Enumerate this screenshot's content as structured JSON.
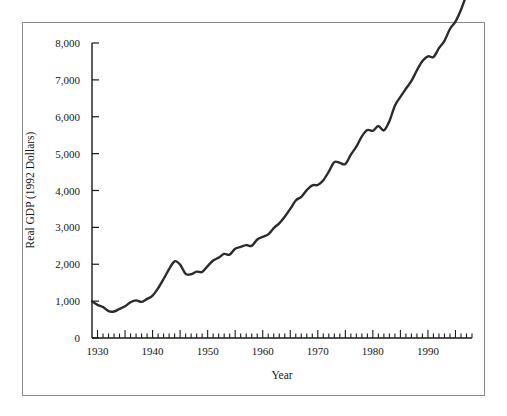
{
  "chart_data": {
    "type": "line",
    "title": "",
    "xlabel": "Year",
    "ylabel": "Real GDP (1992 Dollars)",
    "xlim": [
      1929,
      1998
    ],
    "ylim": [
      0,
      8000
    ],
    "grid": false,
    "legend": "none",
    "x_ticks_major": [
      1930,
      1940,
      1950,
      1960,
      1970,
      1980,
      1990
    ],
    "x_tick_labels": [
      "1930",
      "1940",
      "1950",
      "1960",
      "1970",
      "1980",
      "1990"
    ],
    "x_minor_tick_interval": 1,
    "x_major_tick_interval": 5,
    "y_ticks": [
      0,
      1000,
      2000,
      3000,
      4000,
      5000,
      6000,
      7000,
      8000
    ],
    "y_tick_labels": [
      "0",
      "1,000",
      "2,000",
      "3,000",
      "4,000",
      "5,000",
      "6,000",
      "7,000",
      "8,000"
    ],
    "series_name": "Real GDP",
    "line_color": "#2b2b2b",
    "line_width": 2.4,
    "x": [
      1929,
      1930,
      1931,
      1932,
      1933,
      1934,
      1935,
      1936,
      1937,
      1938,
      1939,
      1940,
      1941,
      1942,
      1943,
      1944,
      1945,
      1946,
      1947,
      1948,
      1949,
      1950,
      1951,
      1952,
      1953,
      1954,
      1955,
      1956,
      1957,
      1958,
      1959,
      1960,
      1961,
      1962,
      1963,
      1964,
      1965,
      1966,
      1967,
      1968,
      1969,
      1970,
      1971,
      1972,
      1973,
      1974,
      1975,
      1976,
      1977,
      1978,
      1979,
      1980,
      1981,
      1982,
      1983,
      1984,
      1985,
      1986,
      1987,
      1988,
      1989,
      1990,
      1991,
      1992,
      1993,
      1994,
      1995,
      1996,
      1997,
      1998
    ],
    "values": [
      990,
      900,
      840,
      730,
      720,
      790,
      860,
      970,
      1020,
      980,
      1060,
      1150,
      1350,
      1600,
      1870,
      2010,
      1990,
      1770,
      1750,
      1820,
      1810,
      1970,
      2120,
      2200,
      2300,
      2290,
      2450,
      2500,
      2550,
      2530,
      2700,
      2770,
      2840,
      3010,
      3140,
      3320,
      3530,
      3760,
      3860,
      4040,
      4170,
      4180,
      4310,
      4540,
      4800,
      4780,
      4760,
      5010,
      5240,
      5530,
      5700,
      5680,
      5820,
      5700,
      5960,
      6390,
      6640,
      6870,
      7090,
      7390,
      7650,
      7790,
      7780,
      8030,
      8250,
      8580,
      8790,
      9120,
      9540,
      9950
    ],
    "values_scaled_note": "plotted in billions of 1992 dollars",
    "plotted_values": [
      990,
      900,
      840,
      730,
      720,
      790,
      860,
      970,
      1020,
      980,
      1060,
      1150,
      1350,
      1600,
      1870,
      2080,
      1990,
      1740,
      1730,
      1800,
      1790,
      1950,
      2100,
      2180,
      2280,
      2260,
      2420,
      2470,
      2520,
      2500,
      2670,
      2740,
      2810,
      2980,
      3110,
      3290,
      3500,
      3730,
      3830,
      4010,
      4140,
      4150,
      4280,
      4510,
      4770,
      4750,
      4720,
      4970,
      5190,
      5470,
      5640,
      5620,
      5750,
      5630,
      5880,
      6300,
      6540,
      6760,
      6970,
      7260,
      7510,
      7640,
      7620,
      7860,
      8060,
      8380,
      8580,
      8900,
      9310,
      9700
    ]
  },
  "axes": {
    "y_axis_name": "Real GDP (1992 Dollars)",
    "x_axis_name": "Year"
  }
}
